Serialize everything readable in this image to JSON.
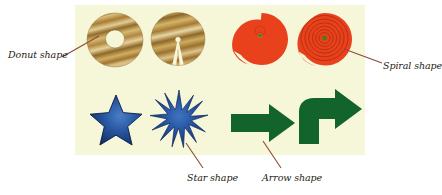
{
  "figure": {
    "background_color": "#ffffff",
    "panel": {
      "color": "#f6f6d8",
      "x": 75,
      "y": 5,
      "width": 290,
      "height": 150
    }
  },
  "palette": {
    "wood_light": "#d8bb72",
    "wood_mid": "#b8904a",
    "wood_dark": "#8a6526",
    "wood_pale": "#e8d9a8",
    "red_orange": "#e8411c",
    "red_deep": "#c4300f",
    "green_dot": "#4c7a1c",
    "blue_dark": "#15306b",
    "blue_mid": "#1f4e99",
    "blue_light": "#3f74c0",
    "green_arrow": "#13642c",
    "leader_line": "#8d4a37",
    "label_text": "#241c16"
  },
  "shapes": [
    {
      "id": "donut",
      "name": "Donut shape",
      "row": 1,
      "column": 1,
      "style": "wood-grain ring",
      "fill": "wood grain tan and brown",
      "has_hole": true
    },
    {
      "id": "cut-donut",
      "name": "Cut donut shape",
      "row": 1,
      "column": 2,
      "style": "wood-grain disc with wedge notch",
      "fill": "wood grain tan and brown",
      "has_hole": false
    },
    {
      "id": "spiral-nautilus",
      "name": "Spiral shape",
      "row": 1,
      "column": 3,
      "style": "open nautilus spiral",
      "fill": "#e8411c",
      "center_dot": "#4c7a1c"
    },
    {
      "id": "spiral-coiled",
      "name": "Spiral shape",
      "row": 1,
      "column": 4,
      "style": "tightly coiled spiral disc",
      "fill": "#e8411c",
      "center_dot": "#4c7a1c"
    },
    {
      "id": "star-five-point",
      "name": "Star shape",
      "row": 2,
      "column": 1,
      "style": "five pointed star",
      "fill": "#1f4e99"
    },
    {
      "id": "star-burst",
      "name": "Star shape",
      "row": 2,
      "column": 2,
      "style": "twelve pointed starburst",
      "fill": "#1f4e99"
    },
    {
      "id": "arrow-straight",
      "name": "Arrow shape",
      "row": 2,
      "column": 3,
      "style": "straight block arrow pointing right",
      "fill": "#13642c"
    },
    {
      "id": "arrow-bent",
      "name": "Arrow shape",
      "row": 2,
      "column": 4,
      "style": "bent elbow arrow turning right",
      "fill": "#13642c"
    }
  ],
  "callouts": [
    {
      "id": "callout-donut",
      "label": "Donut shape",
      "target_shape": "donut",
      "text_x": 8,
      "text_y": 55,
      "align": "left"
    },
    {
      "id": "callout-spiral",
      "label": "Spiral shape",
      "target_shape": "spiral-coiled",
      "text_x": 383,
      "text_y": 66,
      "align": "left"
    },
    {
      "id": "callout-star",
      "label": "Star shape",
      "target_shape": "star-burst",
      "text_x": 187,
      "text_y": 179,
      "align": "left"
    },
    {
      "id": "callout-arrow",
      "label": "Arrow shape",
      "target_shape": "arrow-straight",
      "text_x": 262,
      "text_y": 179,
      "align": "left"
    }
  ]
}
